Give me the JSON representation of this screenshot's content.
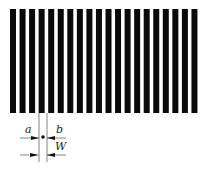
{
  "diagram": {
    "stripe_count": 20,
    "stripe_color": "#0a0a0a",
    "background": "#ffffff",
    "stripe_top": 9,
    "stripe_bottom": 113,
    "first_stripe_x": 10,
    "stripe_width": 6,
    "stripe_period": 9.55,
    "labels": {
      "a": "a",
      "b": "b",
      "W": "W"
    },
    "annotation": {
      "left_line_x": 39,
      "right_line_x": 47,
      "dot": {
        "x": 43,
        "y": 137
      }
    }
  }
}
